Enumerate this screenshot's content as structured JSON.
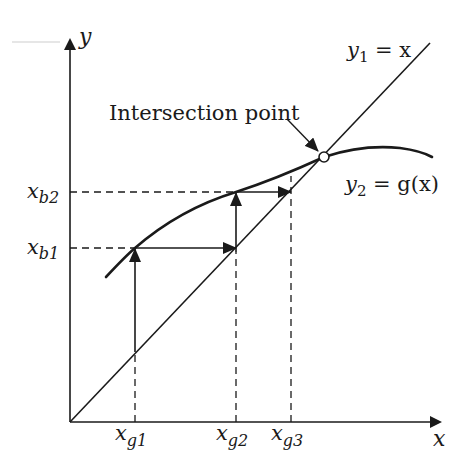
{
  "diagram": {
    "axes": {
      "x_label": "x",
      "y_label": "y"
    },
    "curves": {
      "line_label_var": "y",
      "line_label_sub": "1",
      "line_label_rest": " = x",
      "curve_label_var": "y",
      "curve_label_sub": "2",
      "curve_label_rest": " = g(x)"
    },
    "annotation": {
      "text": "Intersection point"
    },
    "x_ticks": [
      {
        "var": "x",
        "sub": "g1"
      },
      {
        "var": "x",
        "sub": "g2"
      },
      {
        "var": "x",
        "sub": "g3"
      }
    ],
    "y_ticks": [
      {
        "var": "x",
        "sub": "b1"
      },
      {
        "var": "x",
        "sub": "b2"
      }
    ],
    "colors": {
      "ink": "#1a1a1a",
      "background": "#ffffff"
    }
  }
}
